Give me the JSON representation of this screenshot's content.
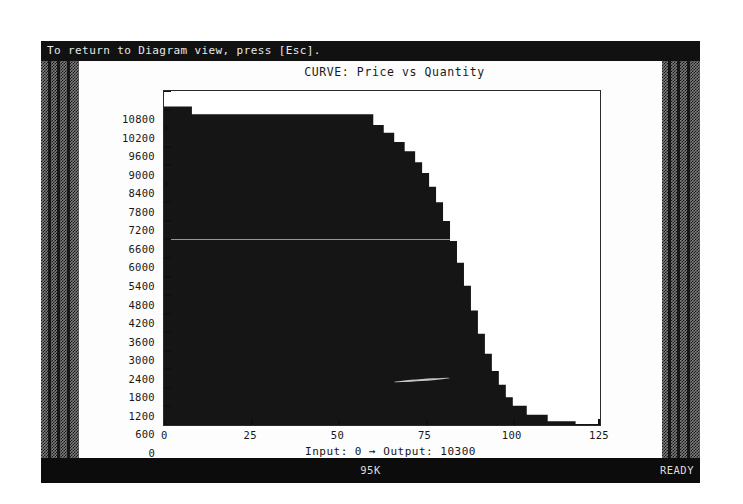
{
  "window": {
    "message": "To return to Diagram view, press [Esc].",
    "status_memory": "95K",
    "status_state": "READY"
  },
  "readout": {
    "text": "Input: 0 → Output: 10300",
    "input_label": "Input:",
    "input_value": "0",
    "arrow": "→",
    "output_label": "Output:",
    "output_value": "10300"
  },
  "colors": {
    "frame": "#0d0d0d",
    "paper": "#fdfdfd",
    "ink": "#151515",
    "rail": "#7d7d7d",
    "status_bg": "#0c0c0c",
    "status_fg": "#dcdcdc"
  },
  "chart_data": {
    "type": "area",
    "title": "CURVE: Price vs Quantity",
    "xlabel": "",
    "ylabel": "",
    "xlim": [
      0,
      125
    ],
    "ylim": [
      0,
      10800
    ],
    "grid": false,
    "legend": "none",
    "x_ticks": [
      "0",
      "25",
      "50",
      "75",
      "100",
      "125"
    ],
    "x_tick_values": [
      0,
      25,
      50,
      75,
      100,
      125
    ],
    "y_ticks": [
      "10800",
      "10200",
      "9600",
      "9000",
      "8400",
      "7800",
      "7200",
      "6600",
      "6000",
      "5400",
      "4800",
      "4200",
      "3600",
      "3000",
      "2400",
      "1800",
      "1200",
      "600",
      "0"
    ],
    "y_tick_values": [
      10800,
      10200,
      9600,
      9000,
      8400,
      7800,
      7200,
      6600,
      6000,
      5400,
      4800,
      4200,
      3600,
      3000,
      2400,
      1800,
      1200,
      600,
      0
    ],
    "x": [
      0,
      4,
      8,
      12,
      16,
      20,
      24,
      28,
      32,
      36,
      40,
      44,
      48,
      52,
      56,
      60,
      63,
      66,
      69,
      72,
      74,
      76,
      78,
      80,
      82,
      84,
      86,
      88,
      90,
      92,
      94,
      96,
      98,
      100,
      104,
      110,
      118,
      125
    ],
    "values": [
      10300,
      10300,
      10050,
      10050,
      10050,
      10050,
      10050,
      10050,
      10050,
      10050,
      10050,
      10050,
      10050,
      10050,
      10050,
      9700,
      9450,
      9150,
      8850,
      8500,
      8150,
      7700,
      7200,
      6600,
      5950,
      5250,
      4500,
      3700,
      2950,
      2300,
      1750,
      1300,
      900,
      620,
      330,
      120,
      30,
      0
    ],
    "annotation": "Input: 0 → Output: 10300"
  }
}
